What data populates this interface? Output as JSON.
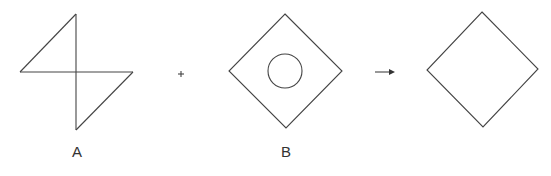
{
  "figures": [
    {
      "id": "A",
      "label": "A",
      "shape": "two-right-triangles-pinwheel"
    },
    {
      "id": "B",
      "label": "B",
      "shape": "diamond-with-inner-circle"
    },
    {
      "id": "result",
      "label": "",
      "shape": "diamond"
    }
  ],
  "operators": {
    "plus": "+",
    "arrow": "→"
  },
  "colors": {
    "stroke": "#444444",
    "background": "#ffffff"
  }
}
